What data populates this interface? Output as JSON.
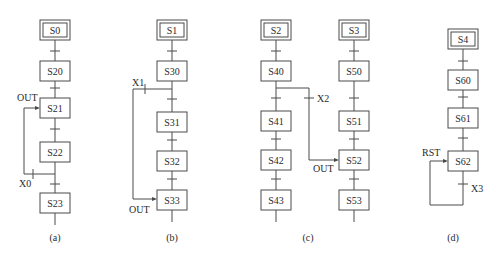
{
  "diagrams": [
    {
      "id": "a",
      "caption": "(a)",
      "cx": 55,
      "steps": [
        {
          "label": "S0",
          "y": 20,
          "initial": true
        },
        {
          "label": "S20",
          "y": 61
        },
        {
          "label": "S21",
          "y": 98
        },
        {
          "label": "S22",
          "y": 142
        },
        {
          "label": "S23",
          "y": 193
        }
      ],
      "transitions_y": [
        51,
        88,
        129,
        184
      ],
      "annotations": [
        {
          "text": "OUT",
          "x": 17,
          "y": 101
        },
        {
          "text": "X0",
          "x": 19,
          "y": 187
        }
      ],
      "caption_xy": [
        55,
        241
      ]
    },
    {
      "id": "b",
      "caption": "(b)",
      "cx": 172,
      "steps": [
        {
          "label": "S1",
          "y": 20,
          "initial": true
        },
        {
          "label": "S30",
          "y": 61
        },
        {
          "label": "S31",
          "y": 112
        },
        {
          "label": "S32",
          "y": 151
        },
        {
          "label": "S33",
          "y": 190
        }
      ],
      "transitions_y": [
        51,
        99,
        140,
        179
      ],
      "annotations": [
        {
          "text": "X1",
          "x": 132,
          "y": 86
        },
        {
          "text": "OUT",
          "x": 129,
          "y": 213
        }
      ],
      "caption_xy": [
        172,
        241
      ]
    },
    {
      "id": "c-left",
      "caption": "(c)",
      "cx": 276,
      "steps": [
        {
          "label": "S2",
          "y": 20,
          "initial": true
        },
        {
          "label": "S40",
          "y": 61
        },
        {
          "label": "S41",
          "y": 111
        },
        {
          "label": "S42",
          "y": 150
        },
        {
          "label": "S43",
          "y": 190
        }
      ],
      "transitions_y": [
        51,
        98,
        139,
        179
      ],
      "annotations": [],
      "caption_xy": [
        308,
        241
      ]
    },
    {
      "id": "c-right",
      "caption": "",
      "cx": 354,
      "steps": [
        {
          "label": "S3",
          "y": 20,
          "initial": true
        },
        {
          "label": "S50",
          "y": 61
        },
        {
          "label": "S51",
          "y": 111
        },
        {
          "label": "S52",
          "y": 150
        },
        {
          "label": "S53",
          "y": 190
        }
      ],
      "transitions_y": [
        51,
        98,
        139,
        179
      ],
      "annotations": [
        {
          "text": "X2",
          "x": 317,
          "y": 102
        },
        {
          "text": "OUT",
          "x": 313,
          "y": 172
        }
      ]
    },
    {
      "id": "d",
      "caption": "(d)",
      "cx": 463,
      "steps": [
        {
          "label": "S4",
          "y": 29,
          "initial": true
        },
        {
          "label": "S60",
          "y": 70
        },
        {
          "label": "S61",
          "y": 108
        },
        {
          "label": "S62",
          "y": 151
        }
      ],
      "transitions_y": [
        61,
        97,
        138,
        184
      ],
      "annotations": [
        {
          "text": "RST",
          "x": 422,
          "y": 156
        },
        {
          "text": "X3",
          "x": 471,
          "y": 192
        }
      ],
      "caption_xy": [
        453,
        241
      ]
    }
  ],
  "captions": {
    "a": "(a)",
    "b": "(b)",
    "c": "(c)",
    "d": "(d)"
  },
  "colors": {
    "line": "#4a4a4a",
    "text": "#2a2a2a",
    "background": "#ffffff"
  }
}
